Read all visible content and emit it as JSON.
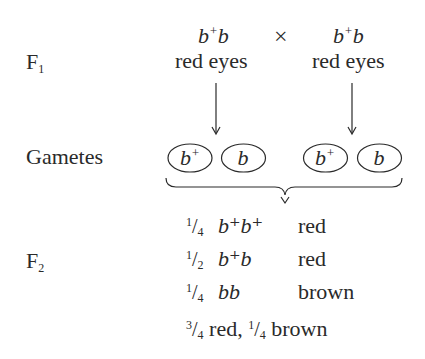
{
  "parents": {
    "left": {
      "genotype_base": "b",
      "genotype_sup": "+",
      "genotype_rest": "b",
      "phenotype": "red eyes"
    },
    "cross_symbol": "×",
    "right": {
      "genotype_base": "b",
      "genotype_sup": "+",
      "genotype_rest": "b",
      "phenotype": "red eyes"
    }
  },
  "labels": {
    "f1": {
      "base": "F",
      "sub": "1"
    },
    "gametes": "Gametes",
    "f2": {
      "base": "F",
      "sub": "2"
    }
  },
  "gametes": [
    {
      "allele": "b",
      "sup": "+"
    },
    {
      "allele": "b",
      "sup": ""
    },
    {
      "allele": "b",
      "sup": "+"
    },
    {
      "allele": "b",
      "sup": ""
    }
  ],
  "f2_rows": [
    {
      "num": "1",
      "den": "4",
      "genotype": "b⁺b⁺",
      "phenotype": "red"
    },
    {
      "num": "1",
      "den": "2",
      "genotype": "b⁺b",
      "phenotype": "red"
    },
    {
      "num": "1",
      "den": "4",
      "genotype": "bb",
      "phenotype": "brown"
    }
  ],
  "ratio_summary": {
    "red_num": "3",
    "red_den": "4",
    "red_label": "red,",
    "brown_num": "1",
    "brown_den": "4",
    "brown_label": "brown"
  }
}
